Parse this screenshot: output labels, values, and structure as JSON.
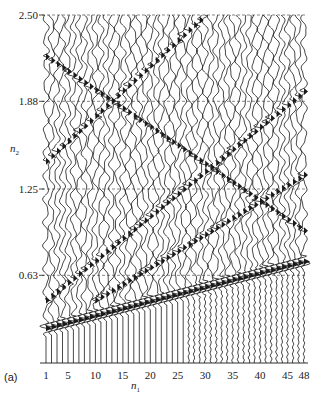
{
  "figure": {
    "panel_label": "(a)",
    "x_axis": {
      "label_base": "n",
      "label_sub": "1"
    },
    "y_axis": {
      "label_base": "n",
      "label_sub": "2"
    }
  },
  "colors": {
    "trace": "#1a1a1a",
    "grid": "#333333",
    "background": "#ffffff"
  },
  "chart_data": {
    "type": "seismic-wiggle",
    "title": "",
    "xlabel": "n1",
    "ylabel": "n2",
    "x_ticks": [
      1,
      5,
      10,
      15,
      20,
      25,
      30,
      35,
      40,
      45,
      48
    ],
    "y_ticks": [
      "2.50",
      "1.88",
      "1.25",
      "0.63"
    ],
    "y_tick_values": [
      2.5,
      1.88,
      1.25,
      0.63
    ],
    "xlim": [
      1,
      48
    ],
    "ylim": [
      0,
      2.5
    ],
    "n_traces": 48,
    "grid": "dashed horizontal lines at y ticks",
    "events": [
      {
        "name": "first-arrival band",
        "from_trace": 1,
        "to_trace": 48,
        "n2_start": 0.25,
        "n2_end": 0.73
      },
      {
        "name": "dipping event A",
        "from_trace": 1,
        "to_trace": 48,
        "n2_start": 0.45,
        "n2_end": 1.95
      },
      {
        "name": "dipping event B",
        "from_trace": 10,
        "to_trace": 48,
        "n2_start": 0.45,
        "n2_end": 1.35
      },
      {
        "name": "dipping event C",
        "from_trace": 1,
        "to_trace": 30,
        "n2_start": 1.45,
        "n2_end": 2.5
      },
      {
        "name": "back-dipping event",
        "from_trace": 1,
        "to_trace": 48,
        "n2_start": 2.2,
        "n2_end": 0.95
      }
    ]
  }
}
